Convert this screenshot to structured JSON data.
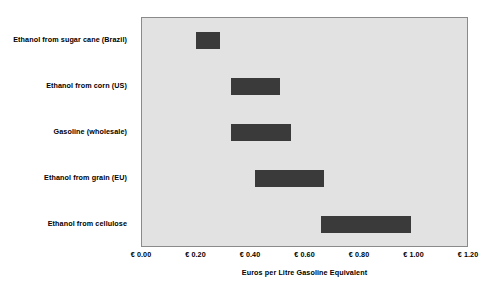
{
  "chart_data": {
    "type": "bar",
    "subtype": "floating-range-bar",
    "orientation": "horizontal",
    "title": "",
    "xlabel": "Euros per Litre Gasoline Equivalent",
    "ylabel": "",
    "xlim": [
      0.0,
      1.2
    ],
    "xticks": [
      0.0,
      0.2,
      0.4,
      0.6,
      0.8,
      1.0,
      1.2
    ],
    "xtick_labels": [
      "€ 0.00",
      "€ 0.20",
      "€ 0.40",
      "€ 0.60",
      "€ 0.80",
      "€ 1.00",
      "€ 1.20"
    ],
    "grid": false,
    "legend": "none",
    "plot_background": "#e2e2e2",
    "bar_color": "#3a3a3a",
    "categories": [
      "Ethanol from sugar cane (Brazil)",
      "Ethanol from corn (US)",
      "Gasoline (wholesale)",
      "Ethanol from grain (EU)",
      "Ethanol from cellulose"
    ],
    "series": [
      {
        "name": "Cost range",
        "ranges": [
          {
            "category": "Ethanol from sugar cane (Brazil)",
            "low": 0.2,
            "high": 0.29
          },
          {
            "category": "Ethanol from corn (US)",
            "low": 0.33,
            "high": 0.51
          },
          {
            "category": "Gasoline (wholesale)",
            "low": 0.33,
            "high": 0.55
          },
          {
            "category": "Ethanol from grain (EU)",
            "low": 0.42,
            "high": 0.67
          },
          {
            "category": "Ethanol from cellulose",
            "low": 0.66,
            "high": 0.99
          }
        ]
      }
    ]
  }
}
